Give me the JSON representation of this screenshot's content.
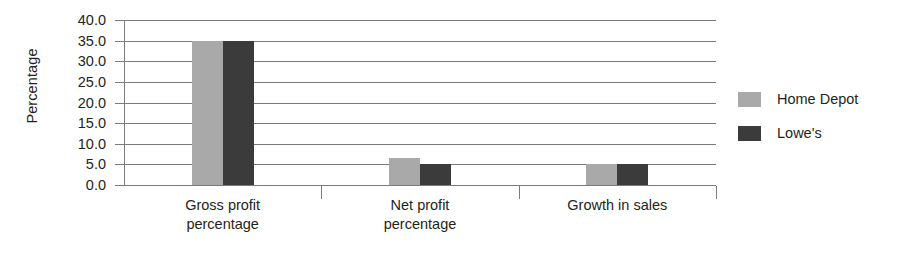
{
  "chart_data": {
    "type": "bar",
    "title": "",
    "xlabel": "",
    "ylabel": "Percentage",
    "ylim": [
      0,
      40
    ],
    "ytick_step": 5,
    "ytick_labels": [
      "40.0",
      "35.0",
      "30.0",
      "25.0",
      "20.0",
      "15.0",
      "10.0",
      "5.0",
      "0.0"
    ],
    "grid": true,
    "legend_position": "right",
    "categories": [
      "Gross profit percentage",
      "Net profit percentage",
      "Growth in sales"
    ],
    "category_label_lines": [
      [
        "Gross profit",
        "percentage"
      ],
      [
        "Net profit",
        "percentage"
      ],
      [
        "Growth in sales"
      ]
    ],
    "series": [
      {
        "name": "Home Depot",
        "color": "#a9a9a9",
        "values": [
          35.0,
          6.5,
          5.2
        ]
      },
      {
        "name": "Lowe's",
        "color": "#3b3b3b",
        "values": [
          35.0,
          5.0,
          5.2
        ]
      }
    ]
  }
}
